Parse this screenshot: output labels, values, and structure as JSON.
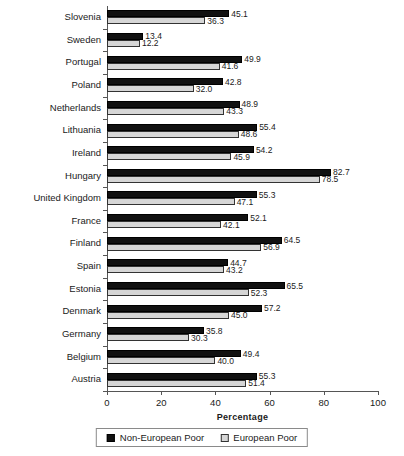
{
  "chart_data": {
    "type": "bar",
    "orientation": "horizontal",
    "title": "",
    "xlabel": "Percentage",
    "ylabel": "",
    "xlim": [
      0,
      100
    ],
    "xticks": [
      0,
      20,
      40,
      60,
      80,
      100
    ],
    "grid": false,
    "legend_position": "bottom",
    "categories": [
      "Slovenia",
      "Sweden",
      "Portugal",
      "Poland",
      "Netherlands",
      "Lithuania",
      "Ireland",
      "Hungary",
      "United Kingdom",
      "France",
      "Finland",
      "Spain",
      "Estonia",
      "Denmark",
      "Germany",
      "Belgium",
      "Austria"
    ],
    "series": [
      {
        "name": "Non-European Poor",
        "color": "#111111",
        "values": [
          45.1,
          13.4,
          49.9,
          42.8,
          48.9,
          55.4,
          54.2,
          82.7,
          55.3,
          52.1,
          64.5,
          44.7,
          65.5,
          57.2,
          35.8,
          49.4,
          55.3
        ]
      },
      {
        "name": "European Poor",
        "color": "#d6d6d6",
        "values": [
          36.3,
          12.2,
          41.6,
          32.0,
          43.3,
          48.6,
          45.9,
          78.5,
          47.1,
          42.1,
          56.9,
          43.2,
          52.3,
          45.0,
          30.3,
          40.0,
          51.4
        ]
      }
    ]
  }
}
